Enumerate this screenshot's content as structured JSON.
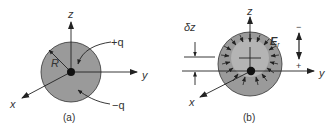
{
  "figure": {
    "panel_a": {
      "caption": "(a)",
      "axes": {
        "z": "z",
        "y": "y",
        "x": "x"
      },
      "radius_label": "R",
      "charge_center_label": "+q",
      "charge_shell_label": "−q"
    },
    "panel_b": {
      "caption": "(b)",
      "axes": {
        "z": "z",
        "y": "y",
        "x": "x"
      },
      "displacement_label": "δz",
      "field_label": "E",
      "field_subscript": "r",
      "minus_sign": "−",
      "plus_sign": "+"
    },
    "colors": {
      "sphere_fill": "#9a9a9a",
      "inner_fill": "#b4b4b4",
      "line": "#222222",
      "text": "#333333"
    }
  }
}
